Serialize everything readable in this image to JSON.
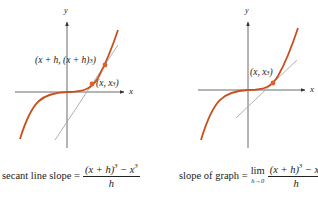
{
  "colors": {
    "curve": "#c8501e",
    "axis": "#444444",
    "secant": "#a8a8a8",
    "point": "#e0602a"
  },
  "left_panel": {
    "axis_x_label": "x",
    "axis_y_label": "y",
    "point_upper_label": "(x + h, (x + h)",
    "point_upper_exp": "3",
    "point_upper_close": ")",
    "point_lower_label": "(x, x",
    "point_lower_exp": "3",
    "point_lower_close": ")",
    "caption_prefix": "secant line slope =",
    "numerator": "(x + h)",
    "numerator_exp": "3",
    "numerator_rest": " − x",
    "numerator_rest_exp": "3",
    "denominator": "h"
  },
  "right_panel": {
    "axis_x_label": "x",
    "axis_y_label": "y",
    "point_label": "(x, x",
    "point_exp": "3",
    "point_close": ")",
    "caption_prefix": "slope of graph =",
    "lim": "lim",
    "lim_sub": "h→0",
    "numerator": "(x + h)",
    "numerator_exp": "3",
    "numerator_rest": " − x",
    "numerator_rest_exp": "3",
    "denominator": "h"
  }
}
